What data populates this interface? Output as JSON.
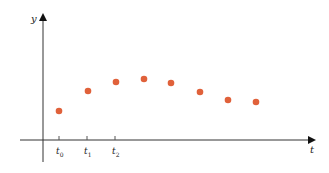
{
  "chart_data": {
    "type": "scatter",
    "title": "",
    "xlabel": "t",
    "ylabel": "y",
    "x_tick_labels": [
      {
        "base": "t",
        "sub": "0"
      },
      {
        "base": "t",
        "sub": "1"
      },
      {
        "base": "t",
        "sub": "2"
      }
    ],
    "points_px": [
      {
        "x": 59,
        "y": 111
      },
      {
        "x": 88,
        "y": 91
      },
      {
        "x": 116,
        "y": 82
      },
      {
        "x": 144,
        "y": 79
      },
      {
        "x": 171,
        "y": 83
      },
      {
        "x": 200,
        "y": 92
      },
      {
        "x": 228,
        "y": 100
      },
      {
        "x": 256,
        "y": 102
      }
    ],
    "points": [
      {
        "t_index": 0,
        "y": 29
      },
      {
        "t_index": 1,
        "y": 49
      },
      {
        "t_index": 2,
        "y": 58
      },
      {
        "t_index": 3,
        "y": 61
      },
      {
        "t_index": 4,
        "y": 57
      },
      {
        "t_index": 5,
        "y": 48
      },
      {
        "t_index": 6,
        "y": 40
      },
      {
        "t_index": 7,
        "y": 38
      }
    ],
    "grid": false,
    "legend": null,
    "colors": {
      "point": "#e0613a",
      "axis": "#222222",
      "tick": "#555555"
    }
  },
  "axes": {
    "origin_px": {
      "x": 43,
      "y": 140
    },
    "x_end_px": 316,
    "y_top_px": 13,
    "y_bottom_px": 162,
    "x_start_px": 20,
    "tick_x_px": [
      59,
      87,
      115
    ]
  }
}
